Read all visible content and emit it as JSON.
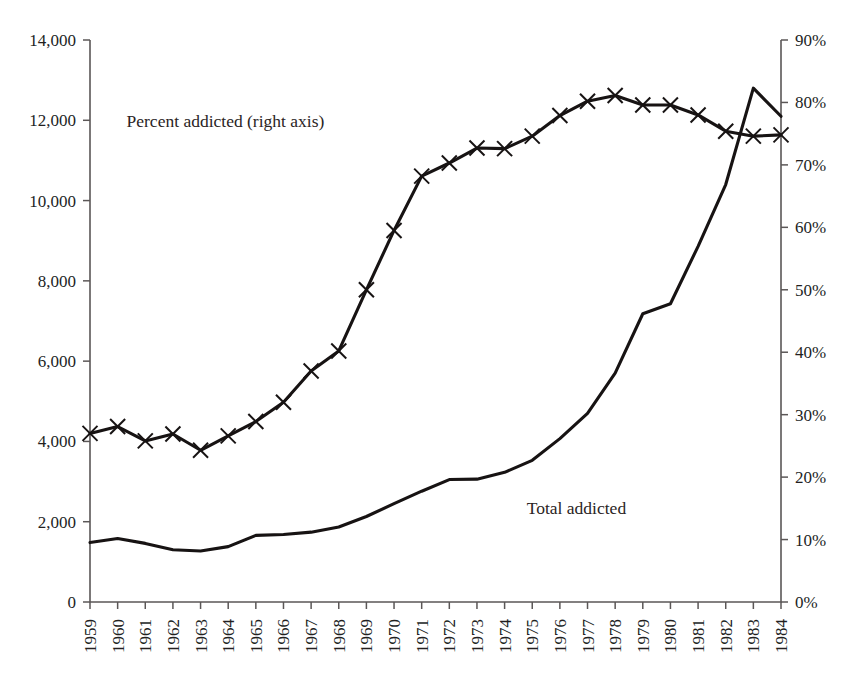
{
  "chart_data": {
    "type": "line",
    "title": "",
    "subtitle": "",
    "xlabel": "",
    "ylabel": "",
    "ylabel_right": "",
    "grid": false,
    "legend_position": "inline-annotation",
    "x": [
      1959,
      1960,
      1961,
      1962,
      1963,
      1964,
      1965,
      1966,
      1967,
      1968,
      1969,
      1970,
      1971,
      1972,
      1973,
      1974,
      1975,
      1976,
      1977,
      1978,
      1979,
      1980,
      1981,
      1982,
      1983,
      1984
    ],
    "x_tick_labels": [
      "1959",
      "1960",
      "1961",
      "1962",
      "1963",
      "1964",
      "1965",
      "1966",
      "1967",
      "1968",
      "1969",
      "1970",
      "1971",
      "1972",
      "1973",
      "1974",
      "1975",
      "1976",
      "1977",
      "1978",
      "1979",
      "1980",
      "1981",
      "1982",
      "1983",
      "1984"
    ],
    "y_left": {
      "ticks": [
        0,
        2000,
        4000,
        6000,
        8000,
        10000,
        12000,
        14000
      ],
      "tick_labels": [
        "0",
        "2,000",
        "4,000",
        "6,000",
        "8,000",
        "10,000",
        "12,000",
        "14,000"
      ],
      "ylim": [
        0,
        14000
      ]
    },
    "y_right": {
      "ticks": [
        0,
        10,
        20,
        30,
        40,
        50,
        60,
        70,
        80,
        90
      ],
      "tick_labels": [
        "0%",
        "10%",
        "20%",
        "30%",
        "40%",
        "50%",
        "60%",
        "70%",
        "80%",
        "90%"
      ],
      "ylim": [
        0,
        90
      ]
    },
    "series": [
      {
        "name": "Total addicted",
        "axis": "left",
        "marker": "none",
        "annotation": "Total addicted",
        "values": [
          1480,
          1580,
          1460,
          1300,
          1270,
          1380,
          1660,
          1680,
          1740,
          1870,
          2130,
          2450,
          2760,
          3050,
          3060,
          3230,
          3530,
          4070,
          4700,
          5700,
          7180,
          7430,
          8860,
          10400,
          12800,
          12100
        ]
      },
      {
        "name": "Percent addicted",
        "axis": "right",
        "marker": "x",
        "annotation": "Percent addicted (right axis)",
        "values": [
          27.0,
          28.1,
          25.8,
          26.9,
          24.3,
          26.6,
          28.9,
          32.0,
          37.0,
          40.2,
          50.0,
          59.5,
          68.2,
          70.3,
          72.7,
          72.6,
          74.6,
          77.9,
          80.2,
          81.1,
          79.6,
          79.6,
          78.0,
          75.4,
          74.6,
          74.8
        ]
      }
    ],
    "annotations": [
      {
        "text": "Percent addicted (right axis)",
        "x": 1963.9,
        "y_right": 76.0
      },
      {
        "text": "Total addicted",
        "x": 1976.6,
        "y_left": 2200
      }
    ]
  },
  "colors": {
    "background": "#ffffff",
    "line": "#171313",
    "axis": "#5b5757",
    "text": "#231f1f"
  }
}
